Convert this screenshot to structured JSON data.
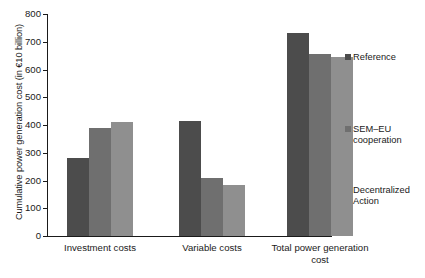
{
  "chart_data": {
    "type": "bar",
    "title": "",
    "xlabel": "",
    "ylabel": "Cumulative power generation cost (in €10 billion)",
    "ylim": [
      0,
      800
    ],
    "ytick_step": 100,
    "yticks": [
      "800",
      "700",
      "600",
      "500",
      "400",
      "300",
      "200",
      "100",
      "0"
    ],
    "grid": false,
    "legend_position": "right",
    "categories": [
      "Investment costs",
      "Variable costs",
      "Total power generation\ncost"
    ],
    "series": [
      {
        "name": "Reference",
        "color": "#4c4c4c",
        "values": [
          280,
          415,
          730
        ]
      },
      {
        "name": "SEM–EU\ncooperation",
        "color": "#6f6f6f",
        "values": [
          390,
          210,
          655
        ]
      },
      {
        "name": "Decentralized\nAction",
        "color": "#8f8f8f",
        "values": [
          410,
          185,
          645
        ]
      }
    ]
  }
}
